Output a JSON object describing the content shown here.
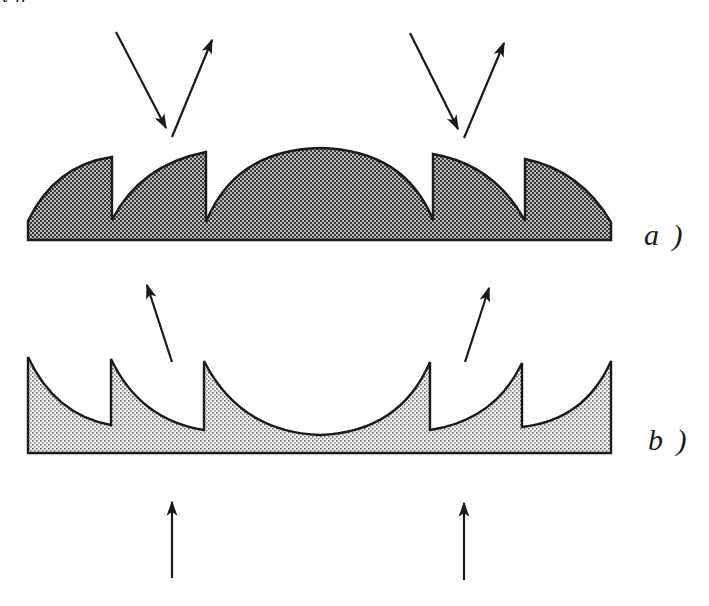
{
  "figure": {
    "panels": [
      {
        "id": "a",
        "label": "a )",
        "fill_style": "dense-dark-stipple",
        "fill_color": "#8c8c8c",
        "stroke_color": "#1a1a1a",
        "profile": "convex-segments",
        "base": {
          "x1": 28,
          "x2": 612,
          "y_bottom": 240
        },
        "path": "M28,240 L28,221 Q55,165 112,157 L112,220 Q140,165 206,152 L206,222 Q235,150 320,148 Q405,150 433,220 L433,154 Q495,165 525,221 L525,159 Q580,170 611,222 L611,240 Z",
        "arrows": [
          {
            "name": "incident-ray-left",
            "from": [
              116,
              32
            ],
            "to": [
              166,
              128
            ]
          },
          {
            "name": "reflected-ray-left",
            "from": [
              172,
              137
            ],
            "to": [
              212,
              40
            ]
          },
          {
            "name": "incident-ray-right",
            "from": [
              410,
              33
            ],
            "to": [
              458,
              129
            ]
          },
          {
            "name": "reflected-ray-right",
            "from": [
              464,
              138
            ],
            "to": [
              504,
              43
            ]
          }
        ]
      },
      {
        "id": "b",
        "label": "b )",
        "fill_style": "light-stipple",
        "fill_color": "#d6d6d6",
        "stroke_color": "#1a1a1a",
        "profile": "concave-segments",
        "base": {
          "x1": 28,
          "x2": 611,
          "y_bottom": 453
        },
        "path": "M28,453 L28,357 Q55,415 111,425 L111,359 Q140,420 204,430 L204,361 Q240,432 320,435 Q400,432 430,362 L430,430 Q495,420 522,363 L522,427 Q585,420 611,361 L611,453 Z",
        "arrows": [
          {
            "name": "transmitted-ray-left",
            "from": [
              172,
              362
            ],
            "to": [
              147,
              285
            ]
          },
          {
            "name": "transmitted-ray-right",
            "from": [
              465,
              362
            ],
            "to": [
              489,
              288
            ]
          },
          {
            "name": "incident-ray-bottom-left",
            "from": [
              172,
              578
            ],
            "to": [
              172,
              502
            ]
          },
          {
            "name": "incident-ray-bottom-right",
            "from": [
              464,
              580
            ],
            "to": [
              464,
              503
            ]
          }
        ]
      }
    ]
  },
  "clipped_header_text": "y          p"
}
